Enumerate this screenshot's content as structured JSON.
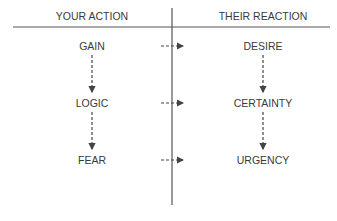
{
  "headers": {
    "left": "YOUR ACTION",
    "right": "THEIR REACTION"
  },
  "rows": [
    {
      "action": "GAIN",
      "reaction": "DESIRE"
    },
    {
      "action": "LOGIC",
      "reaction": "CERTAINTY"
    },
    {
      "action": "FEAR",
      "reaction": "URGENCY"
    }
  ],
  "colors": {
    "line": "#555555",
    "text": "#3a3a3a"
  }
}
